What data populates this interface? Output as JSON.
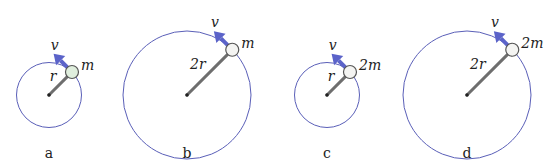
{
  "diagram": {
    "colors": {
      "orbit": "#5a5fb8",
      "velocity_arrow": "#5b63c9",
      "rod": "#6e6e6e",
      "ball_default": "#f4f4f2",
      "ball_highlight": "#dfeedd"
    },
    "panels": [
      {
        "id": "a",
        "label": "a",
        "radius_label": "r",
        "mass_label": "m",
        "velocity_label": "v",
        "radius_multiple": 1,
        "mass_multiple": 1,
        "ball_fill": "ball_highlight"
      },
      {
        "id": "b",
        "label": "b",
        "radius_label": "2r",
        "mass_label": "m",
        "velocity_label": "v",
        "radius_multiple": 2,
        "mass_multiple": 1,
        "ball_fill": "ball_default"
      },
      {
        "id": "c",
        "label": "c",
        "radius_label": "r",
        "mass_label": "2m",
        "velocity_label": "v",
        "radius_multiple": 1,
        "mass_multiple": 2,
        "ball_fill": "ball_default"
      },
      {
        "id": "d",
        "label": "d",
        "radius_label": "2r",
        "mass_label": "2m",
        "velocity_label": "v",
        "radius_multiple": 2,
        "mass_multiple": 2,
        "ball_fill": "ball_default"
      }
    ]
  }
}
